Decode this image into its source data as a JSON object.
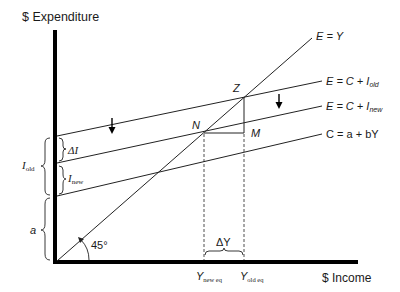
{
  "axes": {
    "y_label": "$ Expenditure",
    "x_label": "$ Income",
    "axis_color": "#000000"
  },
  "lines": {
    "e_equals_y": {
      "label": "E = Y"
    },
    "e_c_i_old": {
      "label_main": "E = C + I",
      "label_sub": "old"
    },
    "e_c_i_new": {
      "label_main": "E = C + I",
      "label_sub": "new"
    },
    "consumption": {
      "label": "C = a + bY"
    }
  },
  "points": {
    "z": "Z",
    "n": "N",
    "m": "M"
  },
  "braces": {
    "delta_i": {
      "label": "ΔI"
    },
    "i_new": {
      "label_main": "I",
      "label_sub": "new"
    },
    "i_old": {
      "label_main": "I",
      "label_sub": "old"
    },
    "a": {
      "label": "a"
    },
    "delta_y": {
      "label": "ΔY"
    }
  },
  "angle": {
    "label": "45°"
  },
  "x_ticks": {
    "y_new_eq": {
      "label_main": "Y",
      "label_sub": "new eq"
    },
    "y_old_eq": {
      "label_main": "Y",
      "label_sub": "old eq"
    }
  },
  "colors": {
    "line": "#222222",
    "text": "#1a1a1a"
  }
}
